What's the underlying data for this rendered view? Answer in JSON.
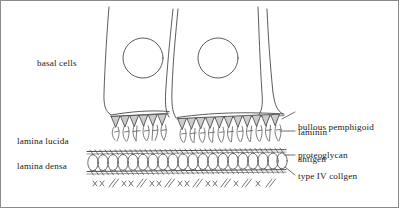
{
  "figure": {
    "width": 399,
    "height": 208,
    "background_color": "#ffffff",
    "border_color": "#8c8c8c",
    "ink_color": "#1a1a1a",
    "hemidesmosome_fill": "#cccccc"
  },
  "labels": {
    "basal_cells": "basal cells",
    "lamina_lucida": "lamina lucida",
    "lamina_densa": "lamina densa",
    "bullous_pemphigoid_antigen_line1": "bullous pemphigoid",
    "bullous_pemphigoid_antigen_line2": "antigen",
    "laminin": "laminin",
    "proteoglycan": "proteoglycan",
    "type_iv_collagen": "type IV collgen"
  },
  "structures": {
    "basal_cells": {
      "name": "basal-cell-layer",
      "count": 3,
      "nucleus_count": 2,
      "description": "Columnar basal keratinocytes with round nuclei, resting on the basement membrane"
    },
    "hemidesmosomes": {
      "name": "hemidesmosome-band",
      "count": 13,
      "shape": "downward triangle",
      "fill": "#cccccc",
      "description": "Gray triangular electron-dense plaques along the basal cell plasma membrane"
    },
    "anchoring_filaments": {
      "name": "anchoring-filament-zone",
      "description": "Branched filaments spanning the lamina lucida between hemidesmosomes and lamina densa"
    },
    "lamina_densa": {
      "name": "lamina-densa-band",
      "description": "Chain-link mesh of linked circles bounded above and below by hatched margins"
    },
    "anchoring_fibrils": {
      "name": "anchoring-fibril-zone",
      "description": "Repeating cross-marks and paired slashes in the papillary dermis below the lamina densa",
      "marks": [
        "××",
        "//"
      ]
    }
  },
  "leader_lines": [
    {
      "name": "leader-bullous-pemphigoid-antigen",
      "target": "hemidesmosome-band"
    },
    {
      "name": "leader-laminin",
      "target": "lamina-lucida"
    },
    {
      "name": "leader-proteoglycan",
      "target": "lamina-densa-band"
    },
    {
      "name": "leader-type-iv-collagen",
      "target": "lamina-densa-band"
    }
  ]
}
